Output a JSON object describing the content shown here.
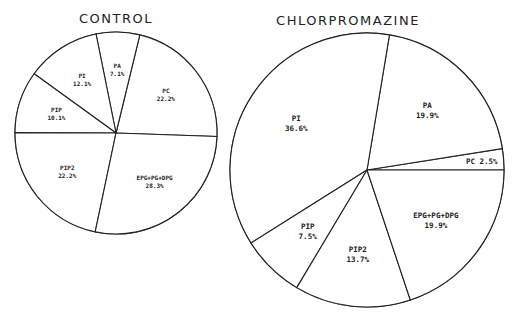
{
  "chart_data": [
    {
      "type": "pie",
      "title": "CONTROL",
      "units": "%",
      "direction": "counter-clockwise",
      "start_angle_deg": -2,
      "slices": [
        {
          "label": "PC",
          "value": 22.2,
          "text": "22.2%"
        },
        {
          "label": "PA",
          "value": 7.1,
          "text": "7.1%"
        },
        {
          "label": "PI",
          "value": 12.1,
          "text": "12.1%"
        },
        {
          "label": "PIP",
          "value": 10.1,
          "text": "10.1%"
        },
        {
          "label": "PIP2",
          "value": 22.2,
          "text": "22.2%"
        },
        {
          "label": "EPG+PG+DPG",
          "value": 28.3,
          "text": "28.3%"
        }
      ]
    },
    {
      "type": "pie",
      "title": "CHLORPROMAZINE",
      "units": "%",
      "direction": "counter-clockwise",
      "start_angle_deg": 0,
      "slices": [
        {
          "label": "PC",
          "value": 2.5,
          "text": "2.5%",
          "inline": true
        },
        {
          "label": "PA",
          "value": 19.9,
          "text": "19.9%"
        },
        {
          "label": "PI",
          "value": 36.6,
          "text": "36.6%"
        },
        {
          "label": "PIP",
          "value": 7.5,
          "text": "7.5%"
        },
        {
          "label": "PIP2",
          "value": 13.7,
          "text": "13.7%"
        },
        {
          "label": "EPG+PG+DPG",
          "value": 19.9,
          "text": "19.9%"
        }
      ]
    }
  ],
  "colors": {
    "line": "#222222",
    "fill": "#ffffff"
  }
}
